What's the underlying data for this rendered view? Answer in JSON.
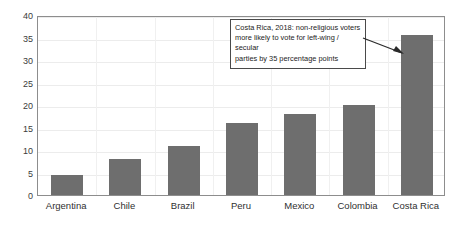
{
  "chart_data": {
    "type": "bar",
    "title": "",
    "subtitle": "",
    "xlabel": "",
    "ylabel": "",
    "categories": [
      "Argentina",
      "Chile",
      "Brazil",
      "Peru",
      "Mexico",
      "Colombia",
      "Costa Rica"
    ],
    "values": [
      4.5,
      8,
      11,
      16,
      18,
      20,
      35.5
    ],
    "ylim": [
      0,
      40
    ],
    "ytick_values": [
      0,
      5,
      10,
      15,
      20,
      25,
      30,
      35,
      40
    ],
    "ytick_labels": [
      "0",
      "5",
      "10",
      "15",
      "20",
      "25",
      "30",
      "35",
      "40"
    ],
    "grid": "horizontal-and-vertical-faint",
    "legend": "none",
    "bar_color": "#6e6e6e",
    "annotations": [
      {
        "name": "costa-rica-callout",
        "text": "Costa Rica, 2018: non-religious voters more likely to vote for left-wing / secular parties by 35 percentage points",
        "lines": [
          "Costa Rica, 2018: non-religious voters",
          "more likely to vote for left-wing / secular",
          "parties by 35 percentage points"
        ],
        "points_to": "Costa Rica"
      }
    ]
  },
  "colors": {
    "bar": "#6e6e6e",
    "frame": "#8d8d8d",
    "gridline": "#ececec",
    "annotation_border": "#4a4a4a",
    "text": "#2f2f2f"
  }
}
